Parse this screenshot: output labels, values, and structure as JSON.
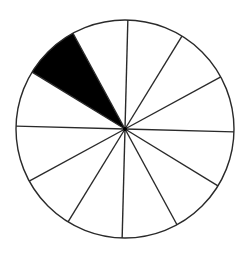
{
  "diagram": {
    "type": "fraction-circle",
    "total_parts": 12,
    "shaded_parts": 1,
    "shaded_sector_indices": [
      10
    ],
    "fraction_shaded": "1/12",
    "center": [
      125,
      129
    ],
    "radius": 109,
    "rotation_offset_deg": 1.5,
    "colors": {
      "background": "#ffffff",
      "stroke": "#2a2a2a",
      "shaded": "#000000",
      "unshaded": "#ffffff"
    },
    "stroke_width": 1.4
  }
}
